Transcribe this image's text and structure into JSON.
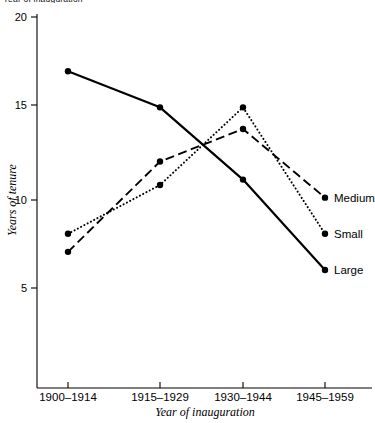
{
  "clipped_header": "Year of inauguration",
  "chart_data": {
    "type": "line",
    "title": "",
    "xlabel": "Year of inauguration",
    "ylabel": "Years of tenure",
    "categories": [
      "1900–1914",
      "1915–1929",
      "1930–1944",
      "1945–1959"
    ],
    "ylim": [
      0,
      20
    ],
    "yticks": [
      5,
      10,
      15,
      20
    ],
    "ytick_labels": [
      "5",
      "10",
      "15",
      "20"
    ],
    "grid": false,
    "legend_position": "right-inline-labels",
    "series": [
      {
        "name": "Large",
        "style": "solid",
        "values": [
          17,
          15,
          11,
          6
        ]
      },
      {
        "name": "Medium",
        "style": "dashed",
        "values": [
          7,
          12,
          13.8,
          10
        ]
      },
      {
        "name": "Small",
        "style": "dotted",
        "values": [
          8,
          10.7,
          15,
          8
        ]
      }
    ]
  }
}
